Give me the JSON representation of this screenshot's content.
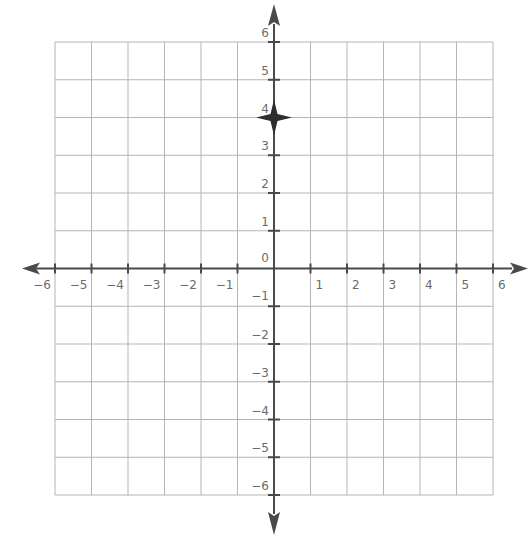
{
  "chart_data": {
    "type": "scatter",
    "title": "",
    "xlabel": "",
    "ylabel": "",
    "xlim": [
      -6,
      6
    ],
    "ylim": [
      -6,
      6
    ],
    "grid": true,
    "x_ticks": [
      -6,
      -5,
      -4,
      -3,
      -2,
      -1,
      1,
      2,
      3,
      4,
      5,
      6
    ],
    "y_ticks": [
      -6,
      -5,
      -4,
      -3,
      -2,
      -1,
      0,
      1,
      2,
      3,
      4,
      5,
      6
    ],
    "x_tick_labels": [
      "−6",
      "−5",
      "−4",
      "−3",
      "−2",
      "−1",
      "1",
      "2",
      "3",
      "4",
      "5",
      "6"
    ],
    "y_tick_labels": [
      "−6",
      "−5",
      "−4",
      "−3",
      "−2",
      "−1",
      "0",
      "1",
      "2",
      "3",
      "4",
      "5",
      "6"
    ],
    "points": [
      {
        "x": 0,
        "y": 4,
        "marker": "four-point-star"
      }
    ],
    "axes_arrows": true
  },
  "colors": {
    "grid": "#b5b5b5",
    "axis": "#4a4a4a",
    "label": "#6b6b6b",
    "point": "#2e2e2e"
  }
}
